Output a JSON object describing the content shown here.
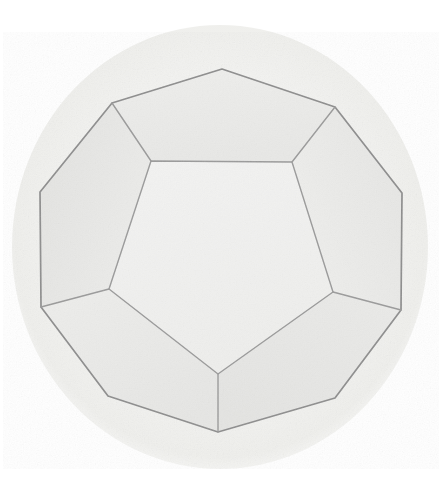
{
  "image": {
    "title": "Dodecahedron",
    "subject": "regular dodecahedron",
    "medium": "pencil drawing",
    "width": 439,
    "height": 485,
    "background_color": "#ffffff",
    "paper_disc": {
      "name": "toned-paper-circle",
      "center_x": 220,
      "center_y": 247,
      "radius_x": 208,
      "radius_y": 222,
      "fill_color": "#f4f4f2",
      "edge_color": "#efefec"
    },
    "stroke": {
      "outline_color": "#8a8a8a",
      "inner_edge_color": "#9a9a9a",
      "outline_width": 1.6,
      "inner_edge_width": 1.4
    },
    "face_colors": {
      "front": "#f1f1f0",
      "upper_left": "#e7e7e5",
      "upper_right": "#e9e9e7",
      "top": "#ececeb",
      "lower_left": "#ececea",
      "lower_right": "#eaeae8",
      "left_rim": "#e5e5e3",
      "right_rim": "#e6e6e4"
    },
    "geometry": {
      "description": "Regular dodecahedron seen face-on: a central pentagon surrounded by five visible side pentagons, bounded by an outer decagon silhouette.",
      "outer_decagon": [
        [
          222,
          69
        ],
        [
          335,
          107
        ],
        [
          402,
          193
        ],
        [
          401,
          310
        ],
        [
          335,
          398
        ],
        [
          218,
          432
        ],
        [
          108,
          396
        ],
        [
          41,
          307
        ],
        [
          40,
          192
        ],
        [
          112,
          103
        ]
      ],
      "inner_pentagon": [
        [
          151,
          161
        ],
        [
          292,
          162
        ],
        [
          333,
          292
        ],
        [
          218,
          374
        ],
        [
          109,
          289
        ]
      ],
      "spokes": [
        {
          "from": [
            151,
            161
          ],
          "to": [
            112,
            103
          ],
          "name": "spoke-upper-left"
        },
        {
          "from": [
            292,
            162
          ],
          "to": [
            335,
            107
          ],
          "name": "spoke-upper-right"
        },
        {
          "from": [
            333,
            292
          ],
          "to": [
            401,
            310
          ],
          "name": "spoke-right"
        },
        {
          "from": [
            218,
            374
          ],
          "to": [
            218,
            432
          ],
          "name": "spoke-bottom"
        },
        {
          "from": [
            109,
            289
          ],
          "to": [
            41,
            307
          ],
          "name": "spoke-left"
        }
      ],
      "vertex_count_visible": 15,
      "visible_faces": 6,
      "total_faces": 12
    }
  }
}
